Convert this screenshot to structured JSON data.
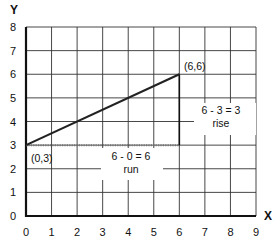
{
  "chart_data": {
    "type": "line",
    "title": "",
    "xlabel": "X",
    "ylabel": "Y",
    "xlim": [
      0,
      9
    ],
    "ylim": [
      0,
      8
    ],
    "grid": true,
    "x_ticks": [
      "0",
      "1",
      "2",
      "3",
      "4",
      "5",
      "6",
      "7",
      "8",
      "9"
    ],
    "y_ticks": [
      "0",
      "1",
      "2",
      "3",
      "4",
      "5",
      "6",
      "7",
      "8"
    ],
    "series": [
      {
        "name": "line",
        "points": [
          [
            0,
            3
          ],
          [
            6,
            6
          ]
        ]
      }
    ],
    "guides": {
      "run": {
        "from": [
          0,
          3
        ],
        "to": [
          6,
          3
        ],
        "style": "dotted"
      },
      "rise": {
        "from": [
          6,
          3
        ],
        "to": [
          6,
          6
        ],
        "style": "solid"
      }
    },
    "annotations": [
      {
        "text": "(6,6)",
        "x": 6,
        "y": 6,
        "position": "above-right"
      },
      {
        "text": "(0,3)",
        "x": 0,
        "y": 3,
        "position": "below-right"
      },
      {
        "text": "6 - 3 = 3",
        "x": 7,
        "y": 5,
        "role": "rise-formula"
      },
      {
        "text": "rise",
        "x": 7,
        "y": 4.5,
        "role": "rise-label"
      },
      {
        "text": "6 - 0 = 6",
        "x": 4.5,
        "y": 2.5,
        "role": "run-formula"
      },
      {
        "text": "run",
        "x": 4.5,
        "y": 2,
        "role": "run-label"
      }
    ]
  },
  "labels": {
    "x_axis": "X",
    "y_axis": "Y",
    "point_end": "(6,6)",
    "point_start": "(0,3)",
    "rise_formula": "6 - 3 = 3",
    "rise_word": "rise",
    "run_formula": "6 - 0 = 6",
    "run_word": "run"
  },
  "colors": {
    "line": "#222222",
    "grid": "#333333",
    "axis": "#111111",
    "dotted": "#777777"
  }
}
